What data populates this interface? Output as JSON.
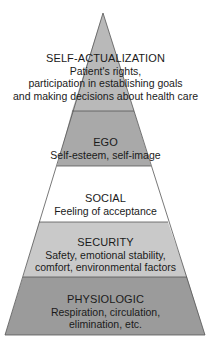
{
  "diagram": {
    "type": "pyramid",
    "levels": [
      {
        "title": "SELF-ACTUALIZATION",
        "lines": [
          "Patient's rights,",
          "participation in establishing goals",
          "and making decisions about health care"
        ],
        "fill": "#b9b9b9"
      },
      {
        "title": "EGO",
        "lines": [
          "Self-esteem, self-image"
        ],
        "fill": "#a9a9a9"
      },
      {
        "title": "SOCIAL",
        "lines": [
          "Feeling of acceptance"
        ],
        "fill": "#ffffff"
      },
      {
        "title": "SECURITY",
        "lines": [
          "Safety, emotional stability,",
          "comfort, environmental factors"
        ],
        "fill": "#c9c9c9"
      },
      {
        "title": "PHYSIOLOGIC",
        "lines": [
          "Respiration, circulation,",
          "elimination, etc."
        ],
        "fill": "#9b9b9b"
      }
    ]
  }
}
